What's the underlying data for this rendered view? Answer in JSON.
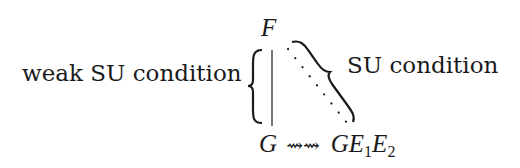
{
  "diagram": {
    "left_label": "weak SU condition",
    "right_label": "SU condition",
    "top_node": "F",
    "bottom_left_node": "G",
    "arrow": "⇝⇝",
    "bottom_right_node": {
      "base": "GE",
      "sub1": "1",
      "mid": "E",
      "sub2": "2"
    },
    "edges": [
      {
        "from": "F",
        "to": "G",
        "style": "solid-vertical",
        "bracket": "left-curly",
        "label": "weak SU condition"
      },
      {
        "from": "F",
        "to": "GE1E2",
        "style": "dotted-diagonal",
        "bracket": "right-curly",
        "label": "SU condition"
      },
      {
        "from": "G",
        "to": "GE1E2",
        "style": "squiggly-arrow"
      }
    ],
    "colors": {
      "ink": "#1a1a1a",
      "background": "#ffffff"
    }
  }
}
